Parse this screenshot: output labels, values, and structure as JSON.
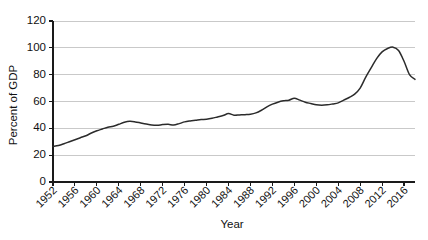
{
  "chart_data": {
    "type": "line",
    "title": "",
    "xlabel": "Year",
    "ylabel": "Percent of GDP",
    "xlim": [
      1952,
      2018
    ],
    "ylim": [
      0,
      120
    ],
    "yticks": [
      0,
      20,
      40,
      60,
      80,
      100,
      120
    ],
    "xticks": [
      1952,
      1956,
      1960,
      1964,
      1968,
      1972,
      1976,
      1980,
      1984,
      1988,
      1992,
      1996,
      2000,
      2004,
      2008,
      2012,
      2016
    ],
    "xtick_labels": [
      "1952",
      "1956",
      "1960",
      "1964",
      "1968",
      "1972",
      "1976",
      "1980",
      "1984",
      "1988",
      "1992",
      "1996",
      "2000",
      "2004",
      "2008",
      "2012",
      "2016"
    ],
    "ytick_labels": [
      "0",
      "20",
      "40",
      "60",
      "80",
      "100",
      "120"
    ],
    "grid": "horizontal",
    "legend": "none",
    "series": [
      {
        "name": "Debt as percent of GDP",
        "color": "#2b2b2b",
        "x": [
          1952,
          1953,
          1954,
          1955,
          1956,
          1957,
          1958,
          1959,
          1960,
          1961,
          1962,
          1963,
          1964,
          1965,
          1966,
          1967,
          1968,
          1969,
          1970,
          1971,
          1972,
          1973,
          1974,
          1975,
          1976,
          1977,
          1978,
          1979,
          1980,
          1981,
          1982,
          1983,
          1984,
          1985,
          1986,
          1987,
          1988,
          1989,
          1990,
          1991,
          1992,
          1993,
          1994,
          1995,
          1996,
          1997,
          1998,
          1999,
          2000,
          2001,
          2002,
          2003,
          2004,
          2005,
          2006,
          2007,
          2008,
          2009,
          2010,
          2011,
          2012,
          2013,
          2014,
          2015,
          2016,
          2017,
          2018
        ],
        "y": [
          26.5,
          27.2,
          28.5,
          30.0,
          31.5,
          33.0,
          34.5,
          36.5,
          38.2,
          39.5,
          40.8,
          41.5,
          43.0,
          44.5,
          45.2,
          44.8,
          44.0,
          43.2,
          42.5,
          42.3,
          42.8,
          43.0,
          42.5,
          43.5,
          44.8,
          45.5,
          46.0,
          46.5,
          46.8,
          47.5,
          48.5,
          49.5,
          51.0,
          49.8,
          50.0,
          50.2,
          50.5,
          51.5,
          53.5,
          56.0,
          58.0,
          59.5,
          60.5,
          61.0,
          62.5,
          61.0,
          59.5,
          58.5,
          57.5,
          57.2,
          57.5,
          58.2,
          59.0,
          61.0,
          63.0,
          65.5,
          70.0,
          78.0,
          85.0,
          92.0,
          97.0,
          99.5,
          100.5,
          98.0,
          90.0,
          80.0,
          76.5
        ],
        "annotations": [
          {
            "year": 1952,
            "value": 26.5,
            "note": "series start"
          },
          {
            "year": 1966,
            "value": 45.2,
            "note": "mid-1960s local peak"
          },
          {
            "year": 1971,
            "value": 42.3,
            "note": "early-1970s trough"
          },
          {
            "year": 1996,
            "value": 62.5,
            "note": "mid-1990s local peak"
          },
          {
            "year": 2001,
            "value": 57.2,
            "note": "early-2000s trough"
          },
          {
            "year": 2014,
            "value": 100.5,
            "note": "maximum near 2009-2010 plotting position"
          }
        ]
      }
    ]
  },
  "axes": {
    "y_title": "Percent of GDP",
    "x_title": "Year"
  }
}
